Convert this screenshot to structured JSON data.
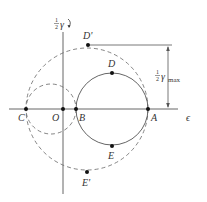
{
  "colors": {
    "line": "#555555",
    "dashed": "#666666",
    "point": "#111111",
    "text": "#333333"
  },
  "axes": {
    "horizontal_label": "ϵ",
    "vertical_label_fraction_num": "1",
    "vertical_label_fraction_den": "2",
    "vertical_label_symbol": "γ",
    "vertical_label_arrow": "↻"
  },
  "points": [
    {
      "id": "C",
      "label": "C",
      "x": 26,
      "y": 109
    },
    {
      "id": "O",
      "label": "O",
      "x": 63,
      "y": 109
    },
    {
      "id": "B",
      "label": "B",
      "x": 76,
      "y": 109
    },
    {
      "id": "A",
      "label": "A",
      "x": 148,
      "y": 109
    },
    {
      "id": "D",
      "label": "D",
      "x": 112,
      "y": 73
    },
    {
      "id": "E",
      "label": "E",
      "x": 112,
      "y": 145
    },
    {
      "id": "D'",
      "label": "D'",
      "x": 87,
      "y": 48
    },
    {
      "id": "E'",
      "label": "E'",
      "x": 87,
      "y": 170
    }
  ],
  "circles": [
    {
      "id": "solid-circle",
      "center": "BA-midpoint",
      "style": "solid",
      "cx": 112,
      "cy": 109,
      "r": 36
    },
    {
      "id": "small-dashed-circle",
      "center": "CB-midpoint",
      "style": "dashed",
      "cx": 51,
      "cy": 109,
      "r": 25
    },
    {
      "id": "large-dashed-circle",
      "center": "CA-midpoint",
      "style": "dashed",
      "cx": 87,
      "cy": 109,
      "r": 61
    }
  ],
  "dimension": {
    "label_num": "1",
    "label_den": "2",
    "label_symbol": "γ",
    "label_subscript": "max"
  }
}
